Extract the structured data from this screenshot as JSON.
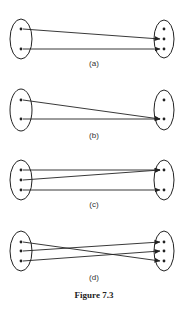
{
  "figure": {
    "caption": "Figure 7.3",
    "stroke_color": "#222222"
  },
  "panels": [
    {
      "label": "(a)",
      "left_dots": 2,
      "right_dots": 3,
      "mappings": [
        [
          1,
          2
        ],
        [
          2,
          3
        ]
      ],
      "description": "injective, not surjective"
    },
    {
      "label": "(b)",
      "left_dots": 2,
      "right_dots": 2,
      "mappings": [
        [
          1,
          2
        ],
        [
          2,
          2
        ]
      ],
      "description": "neither injective nor surjective"
    },
    {
      "label": "(c)",
      "left_dots": 3,
      "right_dots": 2,
      "mappings": [
        [
          1,
          1
        ],
        [
          2,
          1
        ],
        [
          3,
          2
        ]
      ],
      "description": "surjective, not injective"
    },
    {
      "label": "(d)",
      "left_dots": 3,
      "right_dots": 3,
      "mappings": [
        [
          1,
          3
        ],
        [
          2,
          1
        ],
        [
          3,
          2
        ]
      ],
      "description": "bijective"
    }
  ]
}
